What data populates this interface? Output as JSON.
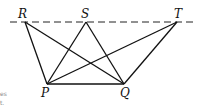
{
  "diagram": {
    "title": "",
    "baseline": {
      "style": "dashed",
      "y": 22,
      "x1": 10,
      "x2": 196
    },
    "points": [
      {
        "name": "R",
        "x": 25,
        "y": 22,
        "label_x": 18,
        "label_y": 18
      },
      {
        "name": "S",
        "x": 86,
        "y": 22,
        "label_x": 81,
        "label_y": 18
      },
      {
        "name": "T",
        "x": 177,
        "y": 22,
        "label_x": 174,
        "label_y": 18
      },
      {
        "name": "P",
        "x": 47,
        "y": 84,
        "label_x": 41,
        "label_y": 97
      },
      {
        "name": "Q",
        "x": 124,
        "y": 84,
        "label_x": 120,
        "label_y": 97
      }
    ],
    "segments": [
      [
        "R",
        "P"
      ],
      [
        "R",
        "Q"
      ],
      [
        "S",
        "P"
      ],
      [
        "S",
        "Q"
      ],
      [
        "T",
        "P"
      ],
      [
        "T",
        "Q"
      ],
      [
        "P",
        "Q"
      ]
    ],
    "cut_off_text": [
      "es",
      "t."
    ]
  }
}
